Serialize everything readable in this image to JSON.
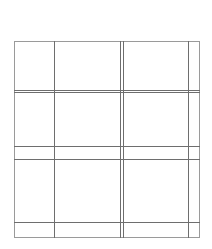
{
  "diagram": {
    "type": "grid-layout",
    "colors": {
      "line": "#6e6e6e",
      "frame": "#9a9a9a",
      "background": "#ffffff"
    },
    "frame": {
      "x0": 14,
      "y0": 41,
      "x1": 199,
      "y1": 237
    },
    "vertical_lines": [
      54,
      120,
      123,
      188
    ],
    "horizontal_lines": [
      90,
      92,
      146,
      159,
      222
    ]
  },
  "caption": {
    "text": ""
  }
}
